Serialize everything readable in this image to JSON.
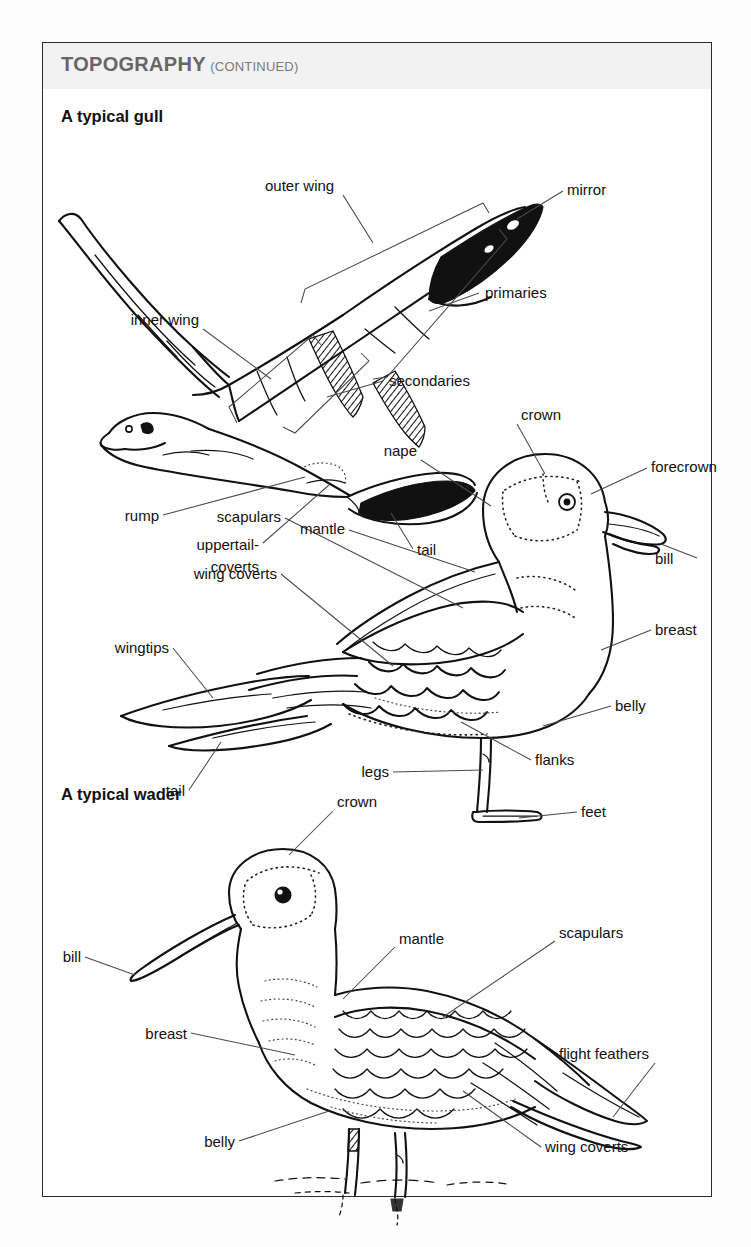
{
  "page": {
    "header_title": "TOPOGRAPHY",
    "header_suffix": "(CONTINUED)",
    "border_color": "#2b2b2b",
    "header_band_color": "#f2f2f2",
    "ink_color": "#111111"
  },
  "sections": [
    {
      "id": "gull",
      "title": "A typical gull"
    },
    {
      "id": "wader",
      "title": "A typical wader"
    }
  ],
  "figures": {
    "flying_gull": {
      "name": "flying gull in flight, viewed from above/behind",
      "labels": [
        {
          "key": "outer_wing",
          "text": "outer wing"
        },
        {
          "key": "inner_wing",
          "text": "inner wing"
        },
        {
          "key": "mirror",
          "text": "mirror"
        },
        {
          "key": "primaries",
          "text": "primaries"
        },
        {
          "key": "secondaries",
          "text": "secondaries"
        },
        {
          "key": "rump",
          "text": "rump"
        },
        {
          "key": "uppertail_coverts_1",
          "text": "uppertail-"
        },
        {
          "key": "uppertail_coverts_2",
          "text": "coverts"
        },
        {
          "key": "tail",
          "text": "tail"
        }
      ]
    },
    "standing_gull": {
      "name": "standing gull, side view facing right",
      "labels": [
        {
          "key": "crown",
          "text": "crown"
        },
        {
          "key": "nape",
          "text": "nape"
        },
        {
          "key": "forecrown",
          "text": "forecrown"
        },
        {
          "key": "mantle",
          "text": "mantle"
        },
        {
          "key": "bill",
          "text": "bill"
        },
        {
          "key": "scapulars",
          "text": "scapulars"
        },
        {
          "key": "breast",
          "text": "breast"
        },
        {
          "key": "wing_coverts",
          "text": "wing coverts"
        },
        {
          "key": "wingtips",
          "text": "wingtips"
        },
        {
          "key": "belly",
          "text": "belly"
        },
        {
          "key": "tail",
          "text": "tail"
        },
        {
          "key": "flanks",
          "text": "flanks"
        },
        {
          "key": "legs",
          "text": "legs"
        },
        {
          "key": "feet",
          "text": "feet"
        }
      ]
    },
    "wader": {
      "name": "standing wader in shallow water, side view facing left",
      "labels": [
        {
          "key": "crown",
          "text": "crown"
        },
        {
          "key": "mantle",
          "text": "mantle"
        },
        {
          "key": "scapulars",
          "text": "scapulars"
        },
        {
          "key": "bill",
          "text": "bill"
        },
        {
          "key": "flight_feathers",
          "text": "flight feathers"
        },
        {
          "key": "breast",
          "text": "breast"
        },
        {
          "key": "belly",
          "text": "belly"
        },
        {
          "key": "wing_coverts",
          "text": "wing coverts"
        }
      ]
    }
  }
}
